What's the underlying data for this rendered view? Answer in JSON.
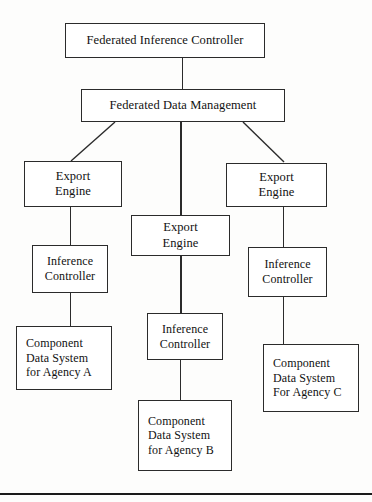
{
  "diagram": {
    "type": "hierarchy-block-diagram",
    "colors": {
      "background": "#fdfdfc",
      "box_fill": "#ffffff",
      "stroke": "#2b2b2b",
      "text": "#111111",
      "rule": "#1a1a1a"
    },
    "nodes": {
      "federated_inference_controller": "Federated Inference Controller",
      "federated_data_management": "Federated Data Management",
      "export_engine_a": "Export\nEngine",
      "export_engine_b": "Export\nEngine",
      "export_engine_c": "Export\nEngine",
      "inference_controller_a": "Inference\nController",
      "inference_controller_b": "Inference\nController",
      "inference_controller_c": "Inference\nController",
      "component_data_system_a": "Component\nData System\nfor Agency A",
      "component_data_system_b": "Component\nData System\nfor Agency B",
      "component_data_system_c": "Component\nData System\nFor Agency C"
    },
    "edges": [
      {
        "from": "federated_inference_controller",
        "to": "federated_data_management",
        "style": "vertical"
      },
      {
        "from": "federated_data_management",
        "to": "export_engine_a",
        "style": "diagonal"
      },
      {
        "from": "federated_data_management",
        "to": "export_engine_b",
        "style": "vertical"
      },
      {
        "from": "federated_data_management",
        "to": "export_engine_c",
        "style": "diagonal"
      },
      {
        "from": "export_engine_a",
        "to": "inference_controller_a",
        "style": "vertical"
      },
      {
        "from": "export_engine_b",
        "to": "inference_controller_b",
        "style": "vertical"
      },
      {
        "from": "export_engine_c",
        "to": "inference_controller_c",
        "style": "vertical"
      },
      {
        "from": "inference_controller_a",
        "to": "component_data_system_a",
        "style": "vertical"
      },
      {
        "from": "inference_controller_b",
        "to": "component_data_system_b",
        "style": "vertical"
      },
      {
        "from": "inference_controller_c",
        "to": "component_data_system_c",
        "style": "vertical"
      }
    ]
  }
}
